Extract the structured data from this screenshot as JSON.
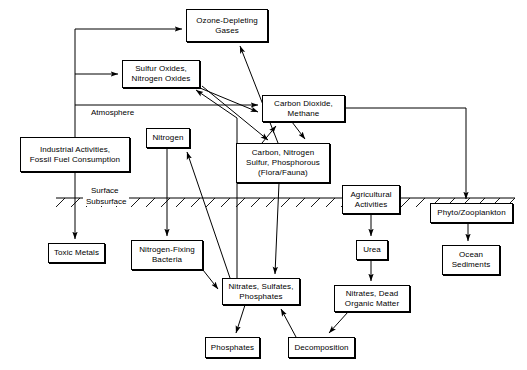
{
  "diagram": {
    "stroke_color": "#000000",
    "background_color": "#ffffff",
    "zone_labels": [
      {
        "name": "surface",
        "text": "Surface"
      },
      {
        "name": "subsurface",
        "text": "Subsurface"
      },
      {
        "name": "atmosphere",
        "text": "Atmosphere"
      }
    ],
    "nodes": [
      {
        "id": "ozone",
        "label": "Ozone-Depleting\nGases"
      },
      {
        "id": "sulfur",
        "label": "Sulfur Oxides,\nNitrogen Oxides"
      },
      {
        "id": "co2",
        "label": "Carbon Dioxide,\nMethane"
      },
      {
        "id": "industrial",
        "label": "Industrial Activities,\nFossil Fuel Consumption"
      },
      {
        "id": "nitrogen",
        "label": "Nitrogen"
      },
      {
        "id": "flora",
        "label": "Carbon, Nitrogen\nSulfur, Phosphorous\n(Flora/Fauna)"
      },
      {
        "id": "toxic",
        "label": "Toxic Metals"
      },
      {
        "id": "nfix",
        "label": "Nitrogen-Fixing\nBacteria"
      },
      {
        "id": "nitrates",
        "label": "Nitrates, Sulfates,\nPhosphates"
      },
      {
        "id": "phosphates",
        "label": "Phosphates"
      },
      {
        "id": "decomposition",
        "label": "Decomposition"
      },
      {
        "id": "agricultural",
        "label": "Agricultural\nActivities"
      },
      {
        "id": "urea",
        "label": "Urea"
      },
      {
        "id": "deadorganic",
        "label": "Nitrates, Dead\nOrganic Matter"
      },
      {
        "id": "plankton",
        "label": "Phyto/Zooplankton"
      },
      {
        "id": "sediments",
        "label": "Ocean\nSediments"
      }
    ],
    "edges": [
      {
        "from": "industrial",
        "to": "ozone"
      },
      {
        "from": "industrial",
        "to": "sulfur"
      },
      {
        "from": "industrial",
        "to": "co2"
      },
      {
        "from": "industrial",
        "to": "toxic"
      },
      {
        "from": "sulfur",
        "to": "co2"
      },
      {
        "from": "sulfur",
        "to": "flora"
      },
      {
        "from": "co2",
        "to": "flora"
      },
      {
        "from": "co2",
        "to": "plankton"
      },
      {
        "from": "flora",
        "to": "co2"
      },
      {
        "from": "flora",
        "to": "ozone"
      },
      {
        "from": "flora",
        "to": "nitrates"
      },
      {
        "from": "nitrogen",
        "to": "nfix"
      },
      {
        "from": "nitrates",
        "to": "nitrogen"
      },
      {
        "from": "nitrates",
        "to": "sulfur"
      },
      {
        "from": "nitrates",
        "to": "phosphates"
      },
      {
        "from": "nfix",
        "to": "nitrates"
      },
      {
        "from": "decomposition",
        "to": "nitrates"
      },
      {
        "from": "deadorganic",
        "to": "decomposition"
      },
      {
        "from": "agricultural",
        "to": "urea"
      },
      {
        "from": "urea",
        "to": "deadorganic"
      },
      {
        "from": "plankton",
        "to": "sediments"
      }
    ]
  }
}
